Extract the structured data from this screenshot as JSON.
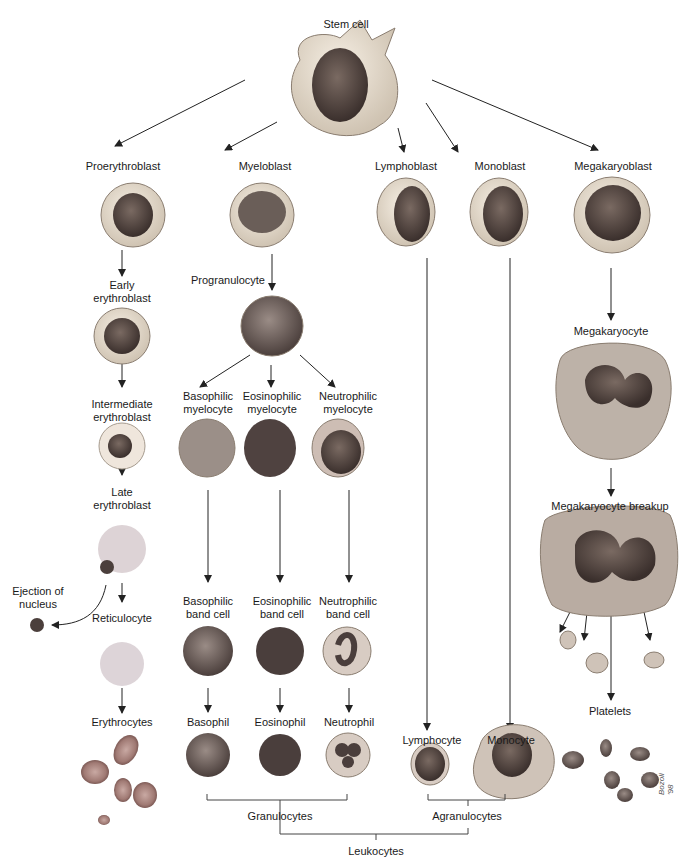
{
  "diagram": {
    "root": {
      "label": "Stem cell"
    },
    "blasts": [
      {
        "id": "proerythroblast",
        "label": "Proerythroblast"
      },
      {
        "id": "myeloblast",
        "label": "Myeloblast"
      },
      {
        "id": "lymphoblast",
        "label": "Lymphoblast"
      },
      {
        "id": "monoblast",
        "label": "Monoblast"
      },
      {
        "id": "megakaryoblast",
        "label": "Megakaryoblast"
      }
    ],
    "erythroid": {
      "early": [
        "Early",
        "erythroblast"
      ],
      "intermediate": [
        "Intermediate",
        "erythroblast"
      ],
      "late": [
        "Late",
        "erythroblast"
      ],
      "ejection": [
        "Ejection of",
        "nucleus"
      ],
      "reticulocyte": "Reticulocyte",
      "erythrocytes": "Erythrocytes"
    },
    "myeloid": {
      "progranulocyte": "Progranulocyte",
      "myelocytes": [
        [
          "Basophilic",
          "myelocyte"
        ],
        [
          "Eosinophilic",
          "myelocyte"
        ],
        [
          "Neutrophilic",
          "myelocyte"
        ]
      ],
      "band_cells": [
        [
          "Basophilic",
          "band cell"
        ],
        [
          "Eosinophilic",
          "band cell"
        ],
        [
          "Neutrophilic",
          "band cell"
        ]
      ],
      "mature": [
        "Basophil",
        "Eosinophil",
        "Neutrophil"
      ]
    },
    "lymphoid": {
      "mature": "Lymphocyte"
    },
    "monocytic": {
      "mature": "Monocyte"
    },
    "megakaryocytic": {
      "megakaryocyte": "Megakaryocyte",
      "breakup": "Megakaryocyte breakup",
      "platelets": "Platelets"
    },
    "groups": {
      "granulocytes": "Granulocytes",
      "agranulocytes": "Agranulocytes",
      "leukocytes": "Leukocytes"
    },
    "signature": "Bozoli '98"
  }
}
